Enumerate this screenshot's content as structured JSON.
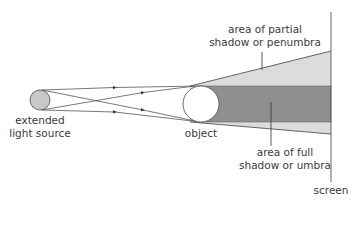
{
  "diagram": {
    "labels": {
      "source": {
        "line1": "extended",
        "line2": "light source"
      },
      "object": "object",
      "penumbra": {
        "line1": "area of partial",
        "line2": "shadow or penumbra"
      },
      "umbra": {
        "line1": "area of full",
        "line2": "shadow or umbra"
      },
      "screen": "screen"
    },
    "colors": {
      "source_fill": "#c8c8c8",
      "outline": "#5a5a5a",
      "umbra": "#8f8f8f",
      "penumbra": "#dcdcdc",
      "object_fill": "#ffffff",
      "ray": "#555555",
      "text": "#3a3a3a"
    }
  }
}
